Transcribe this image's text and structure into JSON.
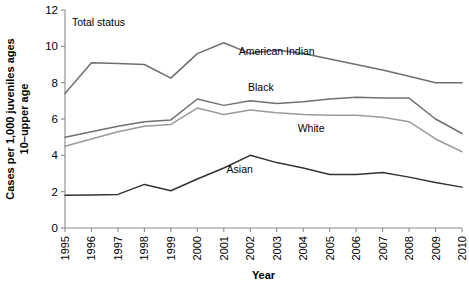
{
  "chart_data": {
    "type": "line",
    "title": "Total status",
    "xlabel": "Year",
    "ylabel": "Cases per 1,000 juveniles ages 10–upper age",
    "ylabel_line1": "Cases per 1,000 juveniles ages",
    "ylabel_line2": "10–upper age",
    "x": [
      1995,
      1996,
      1997,
      1998,
      1999,
      2000,
      2001,
      2002,
      2003,
      2004,
      2005,
      2006,
      2007,
      2008,
      2009,
      2010
    ],
    "xtick_labels": [
      "1995",
      "1996",
      "1997",
      "1998",
      "1999",
      "2000",
      "2001",
      "2002",
      "2003",
      "2004",
      "2005",
      "2006",
      "2007",
      "2008",
      "2009",
      "2010"
    ],
    "ytick_labels": [
      "0",
      "2",
      "4",
      "6",
      "8",
      "10",
      "12"
    ],
    "yticks": [
      0,
      2,
      4,
      6,
      8,
      10,
      12
    ],
    "ylim": [
      0,
      12
    ],
    "xlim": [
      1995,
      2010
    ],
    "grid": false,
    "legend_position": "inline-annotations",
    "series": [
      {
        "name": "American Indian",
        "color": "#6e6e6e",
        "label_x": 2003.0,
        "label_y": 9.55,
        "values": [
          7.4,
          9.1,
          9.05,
          9.0,
          8.25,
          9.6,
          10.2,
          9.6,
          9.8,
          9.6,
          9.3,
          9.0,
          8.7,
          8.35,
          8.0,
          8.0
        ]
      },
      {
        "name": "Black",
        "color": "#707070",
        "label_x": 2002.4,
        "label_y": 7.55,
        "values": [
          5.0,
          5.3,
          5.6,
          5.85,
          5.95,
          7.1,
          6.75,
          7.0,
          6.85,
          6.95,
          7.1,
          7.2,
          7.15,
          7.15,
          6.0,
          5.2
        ]
      },
      {
        "name": "White",
        "color": "#9a9a9a",
        "label_x": 2004.3,
        "label_y": 5.3,
        "values": [
          4.5,
          4.9,
          5.3,
          5.6,
          5.7,
          6.6,
          6.25,
          6.5,
          6.35,
          6.25,
          6.2,
          6.2,
          6.1,
          5.85,
          4.9,
          4.2
        ]
      },
      {
        "name": "Asian",
        "color": "#333333",
        "label_x": 2001.6,
        "label_y": 3.05,
        "values": [
          1.8,
          1.82,
          1.85,
          2.4,
          2.05,
          2.7,
          3.3,
          4.0,
          3.6,
          3.3,
          2.95,
          2.95,
          3.05,
          2.8,
          2.5,
          2.25
        ]
      }
    ]
  }
}
